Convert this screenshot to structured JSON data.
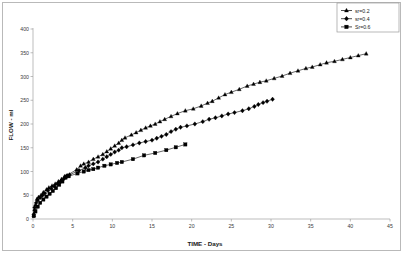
{
  "chart_data": {
    "type": "line",
    "title": "",
    "xlabel": "TIME - Days",
    "ylabel": "FLOW - ml",
    "xlim": [
      0,
      45
    ],
    "ylim": [
      0,
      400
    ],
    "xticks": [
      "0",
      "5",
      "10",
      "15",
      "20",
      "25",
      "30",
      "35",
      "40",
      "45"
    ],
    "yticks": [
      "0",
      "50",
      "100",
      "150",
      "200",
      "250",
      "300",
      "350",
      "400"
    ],
    "grid": false,
    "legend_position": "top-right",
    "series": [
      {
        "name": "sr=0.2",
        "marker": "triangle",
        "color": "#000000",
        "points": [
          [
            0.1,
            8
          ],
          [
            0.2,
            20
          ],
          [
            0.3,
            30
          ],
          [
            0.5,
            42
          ],
          [
            0.7,
            46
          ],
          [
            1.0,
            50
          ],
          [
            1.3,
            56
          ],
          [
            1.7,
            62
          ],
          [
            2.0,
            66
          ],
          [
            2.4,
            70
          ],
          [
            2.8,
            74
          ],
          [
            3.2,
            79
          ],
          [
            3.6,
            84
          ],
          [
            4.0,
            90
          ],
          [
            4.3,
            92
          ],
          [
            5.5,
            104
          ],
          [
            6.0,
            112
          ],
          [
            6.4,
            116
          ],
          [
            7.0,
            120
          ],
          [
            7.6,
            126
          ],
          [
            8.2,
            131
          ],
          [
            8.8,
            136
          ],
          [
            9.3,
            142
          ],
          [
            9.8,
            148
          ],
          [
            10.3,
            154
          ],
          [
            10.8,
            160
          ],
          [
            11.2,
            166
          ],
          [
            11.6,
            171
          ],
          [
            12.4,
            177
          ],
          [
            13.0,
            182
          ],
          [
            13.6,
            187
          ],
          [
            14.2,
            192
          ],
          [
            14.8,
            196
          ],
          [
            15.4,
            200
          ],
          [
            16.0,
            205
          ],
          [
            16.6,
            210
          ],
          [
            17.4,
            216
          ],
          [
            18.2,
            222
          ],
          [
            19.2,
            228
          ],
          [
            20.2,
            232
          ],
          [
            21.2,
            238
          ],
          [
            22.0,
            244
          ],
          [
            22.6,
            248
          ],
          [
            23.4,
            255
          ],
          [
            24.2,
            262
          ],
          [
            25.0,
            267
          ],
          [
            26.0,
            273
          ],
          [
            27.0,
            280
          ],
          [
            27.8,
            284
          ],
          [
            28.6,
            288
          ],
          [
            29.4,
            291
          ],
          [
            30.4,
            296
          ],
          [
            31.4,
            301
          ],
          [
            32.4,
            307
          ],
          [
            33.4,
            312
          ],
          [
            34.4,
            317
          ],
          [
            35.2,
            320
          ],
          [
            36.2,
            325
          ],
          [
            37.0,
            329
          ],
          [
            38.0,
            332
          ],
          [
            39.0,
            336
          ],
          [
            40.0,
            340
          ],
          [
            41.0,
            344
          ],
          [
            42.0,
            348
          ]
        ]
      },
      {
        "name": "sr=0.4",
        "marker": "diamond",
        "color": "#000000",
        "points": [
          [
            0.1,
            10
          ],
          [
            0.2,
            24
          ],
          [
            0.4,
            34
          ],
          [
            0.6,
            40
          ],
          [
            0.9,
            45
          ],
          [
            1.2,
            50
          ],
          [
            1.5,
            54
          ],
          [
            1.9,
            60
          ],
          [
            2.3,
            64
          ],
          [
            2.7,
            69
          ],
          [
            3.1,
            74
          ],
          [
            3.5,
            79
          ],
          [
            3.9,
            85
          ],
          [
            4.2,
            90
          ],
          [
            4.6,
            93
          ],
          [
            5.8,
            102
          ],
          [
            6.6,
            108
          ],
          [
            7.0,
            112
          ],
          [
            7.6,
            116
          ],
          [
            8.2,
            120
          ],
          [
            8.8,
            126
          ],
          [
            9.3,
            131
          ],
          [
            9.8,
            136
          ],
          [
            10.3,
            141
          ],
          [
            10.8,
            145
          ],
          [
            11.2,
            150
          ],
          [
            11.8,
            152
          ],
          [
            12.6,
            156
          ],
          [
            13.4,
            160
          ],
          [
            14.2,
            163
          ],
          [
            15.0,
            166
          ],
          [
            15.6,
            170
          ],
          [
            16.2,
            174
          ],
          [
            16.8,
            178
          ],
          [
            17.4,
            184
          ],
          [
            18.0,
            189
          ],
          [
            18.6,
            193
          ],
          [
            19.4,
            196
          ],
          [
            20.4,
            200
          ],
          [
            21.4,
            205
          ],
          [
            22.2,
            210
          ],
          [
            23.0,
            213
          ],
          [
            23.8,
            217
          ],
          [
            24.6,
            221
          ],
          [
            25.4,
            224
          ],
          [
            26.4,
            228
          ],
          [
            27.2,
            232
          ],
          [
            27.9,
            237
          ],
          [
            28.4,
            241
          ],
          [
            29.0,
            245
          ],
          [
            29.5,
            248
          ],
          [
            30.2,
            252
          ]
        ]
      },
      {
        "name": "Sr=0.6",
        "marker": "square",
        "color": "#000000",
        "points": [
          [
            0.1,
            6
          ],
          [
            0.3,
            16
          ],
          [
            0.6,
            26
          ],
          [
            0.9,
            34
          ],
          [
            1.3,
            41
          ],
          [
            1.7,
            47
          ],
          [
            2.1,
            53
          ],
          [
            2.5,
            59
          ],
          [
            2.9,
            65
          ],
          [
            3.3,
            72
          ],
          [
            3.7,
            79
          ],
          [
            4.1,
            87
          ],
          [
            4.5,
            90
          ],
          [
            5.6,
            96
          ],
          [
            6.4,
            100
          ],
          [
            7.0,
            103
          ],
          [
            7.6,
            105
          ],
          [
            8.2,
            108
          ],
          [
            9.0,
            112
          ],
          [
            9.8,
            115
          ],
          [
            10.6,
            118
          ],
          [
            11.2,
            120
          ],
          [
            12.6,
            126
          ],
          [
            14.0,
            134
          ],
          [
            15.4,
            139
          ],
          [
            16.8,
            145
          ],
          [
            18.0,
            151
          ],
          [
            19.2,
            157
          ]
        ]
      }
    ]
  },
  "legend": {
    "entries": [
      {
        "label": "sr=0.2"
      },
      {
        "label": "sr=0.4"
      },
      {
        "label": "Sr=0.6"
      }
    ]
  }
}
